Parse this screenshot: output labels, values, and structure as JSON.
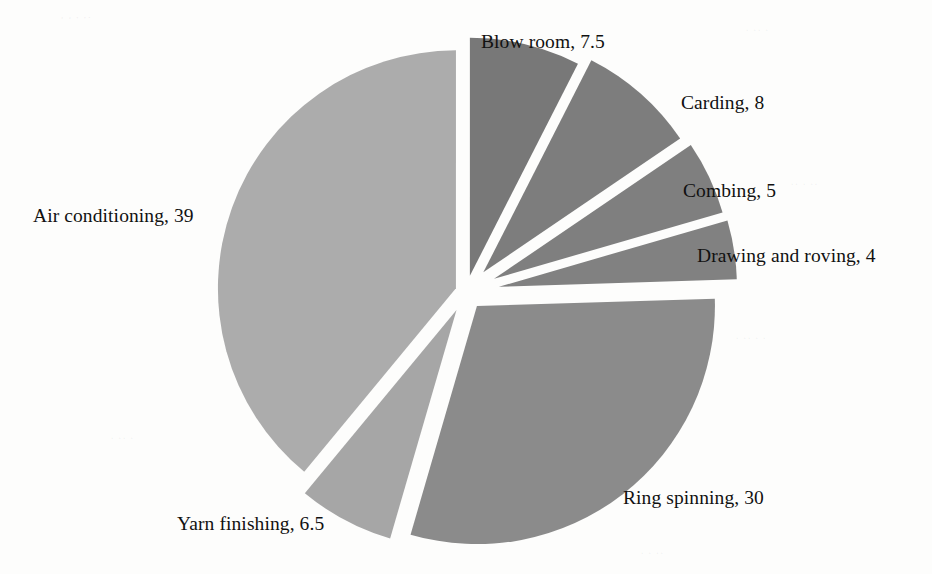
{
  "chart_data": {
    "type": "pie",
    "title": "",
    "subtitle": "",
    "xlabel": "",
    "ylabel": "",
    "legend_position": "none",
    "grid": false,
    "label_format": "name, value",
    "total": 100,
    "categories": [
      "Blow room",
      "Carding",
      "Combing",
      "Drawing and roving",
      "Ring spinning",
      "Yarn finishing",
      "Air conditioning"
    ],
    "values": [
      7.5,
      8,
      5,
      4,
      30,
      6.5,
      39
    ],
    "slices": [
      {
        "name": "Blow room",
        "value": 7.5,
        "label": "Blow room, 7.5",
        "color": "#787878",
        "start_angle": 0,
        "end_angle": 27,
        "explode": 0.07,
        "label_x": 481,
        "label_y": 31,
        "label_align": "left"
      },
      {
        "name": "Carding",
        "value": 8,
        "label": "Carding, 8",
        "color": "#7d7d7d",
        "start_angle": 27,
        "end_angle": 55.8,
        "explode": 0.11,
        "label_x": 681,
        "label_y": 92,
        "label_align": "left"
      },
      {
        "name": "Combing",
        "value": 5,
        "label": "Combing, 5",
        "color": "#7f7f7f",
        "start_angle": 55.8,
        "end_angle": 73.8,
        "explode": 0.13,
        "label_x": 683,
        "label_y": 180,
        "label_align": "left"
      },
      {
        "name": "Drawing and roving",
        "value": 4,
        "label": "Drawing and roving, 4",
        "color": "#818181",
        "start_angle": 73.8,
        "end_angle": 88.2,
        "explode": 0.14,
        "label_x": 697,
        "label_y": 245,
        "label_align": "left"
      },
      {
        "name": "Ring spinning",
        "value": 30,
        "label": "Ring spinning, 30",
        "color": "#8b8b8b",
        "start_angle": 88.2,
        "end_angle": 196.2,
        "explode": 0.075,
        "label_x": 623,
        "label_y": 487,
        "label_align": "left"
      },
      {
        "name": "Yarn finishing",
        "value": 6.5,
        "label": "Yarn finishing, 6.5",
        "color": "#a6a6a6",
        "start_angle": 196.2,
        "end_angle": 219.6,
        "explode": 0.085,
        "label_x": 177,
        "label_y": 513,
        "label_align": "left"
      },
      {
        "name": "Air conditioning",
        "value": 39,
        "label": "Air conditioning, 39",
        "color": "#acacac",
        "start_angle": 219.6,
        "end_angle": 360,
        "explode": 0.045,
        "label_x": 33,
        "label_y": 205,
        "label_align": "left"
      }
    ],
    "geometry": {
      "center_x": 466,
      "center_y": 292,
      "radius": 238,
      "background": "#fdfdfc"
    }
  }
}
